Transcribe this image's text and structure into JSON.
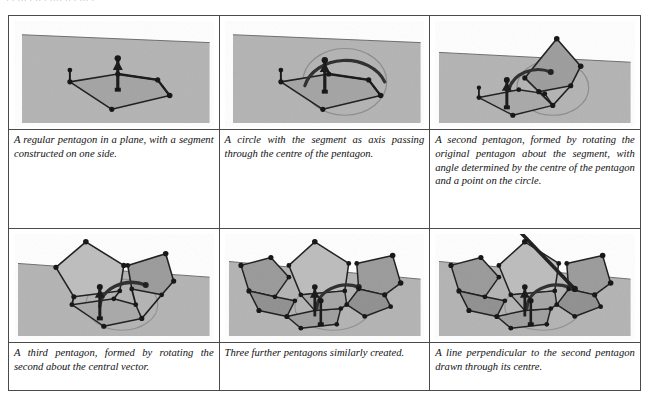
{
  "page": {
    "top_remnant_text": "· ·  ···  · ·· ·  ···· ··  · ··· ·",
    "background_color": "#ffffff",
    "border_color": "#4a4a4a"
  },
  "figure_style": {
    "plane_fill": "#b3b3b3",
    "plane_fill_dark": "#9a9a9a",
    "pentagon_fill_light": "#c2c2c2",
    "pentagon_fill_mid": "#a8a8a8",
    "pentagon_fill_dark": "#8e8e8e",
    "line_color": "#1a1a1a",
    "vertex_color": "#101010",
    "circle_color": "#6f6f6f",
    "arc_color": "#2a2a2a",
    "image_bg": "#ffffff"
  },
  "panels": [
    {
      "index": 1,
      "figure_name": "pentagon-in-plane-with-segment",
      "caption": "A regular pentagon in a plane, with a segment constructed on one side."
    },
    {
      "index": 2,
      "figure_name": "circle-with-segment-as-axis",
      "caption": "A circle with the segment as axis passing through the centre of the pentagon."
    },
    {
      "index": 3,
      "figure_name": "second-pentagon-rotated-about-segment",
      "caption": "A second pentagon, formed by rotating the original pentagon about the segment, with angle determined by the centre of the pentagon and a point on the circle."
    },
    {
      "index": 4,
      "figure_name": "third-pentagon-rotated-about-central-vector",
      "caption": "A third pentagon, formed by rotating the second about the central vector."
    },
    {
      "index": 5,
      "figure_name": "three-further-pentagons",
      "caption": "Three further pentagons similarly created."
    },
    {
      "index": 6,
      "figure_name": "perpendicular-line-through-centre",
      "caption": "A line perpendicular to the second pentagon drawn through its centre."
    }
  ]
}
